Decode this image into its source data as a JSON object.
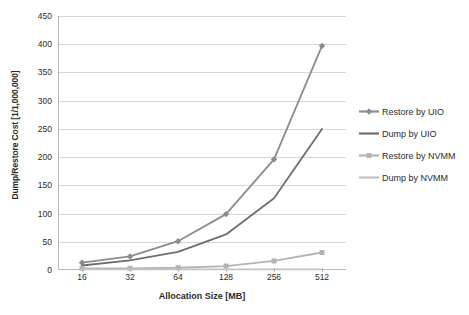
{
  "chart_data": {
    "type": "line",
    "title": "",
    "subtitle": "",
    "xlabel": "Allocation Size [MB]",
    "ylabel": "Dump/Restore Cost [1/1,000,000]",
    "categories": [
      "16",
      "32",
      "64",
      "128",
      "256",
      "512"
    ],
    "ylim": [
      0,
      450
    ],
    "yticks": [
      0,
      50,
      100,
      150,
      200,
      250,
      300,
      350,
      400,
      450
    ],
    "grid": "horizontal",
    "legend_position": "right",
    "series": [
      {
        "name": "Restore by UIO",
        "values": [
          13,
          24,
          51,
          99,
          196,
          397
        ],
        "color": "#8c8c8c",
        "marker": "diamond"
      },
      {
        "name": "Dump by UIO",
        "values": [
          8,
          17,
          32,
          63,
          127,
          250
        ],
        "color": "#6e6e6e",
        "marker": "none"
      },
      {
        "name": "Restore by NVMM",
        "values": [
          3,
          3,
          4,
          7,
          16,
          31
        ],
        "color": "#b3b3b3",
        "marker": "square"
      },
      {
        "name": "Dump by NVMM",
        "values": [
          1,
          1,
          1,
          1,
          1,
          1
        ],
        "color": "#c2c2c2",
        "marker": "none"
      }
    ]
  },
  "axes": {
    "y_title": "Dump/Restore Cost [1/1,000,000]",
    "x_title": "Allocation Size [MB]",
    "y_tick_labels": [
      "450",
      "400",
      "350",
      "300",
      "250",
      "200",
      "150",
      "100",
      "50",
      "0"
    ],
    "x_tick_labels": [
      "16",
      "32",
      "64",
      "128",
      "256",
      "512"
    ]
  },
  "legend": {
    "items": [
      {
        "label": "Restore by UIO"
      },
      {
        "label": "Dump by UIO"
      },
      {
        "label": "Restore by NVMM"
      },
      {
        "label": "Dump by NVMM"
      }
    ]
  },
  "colors": {
    "grid": "#d6d6d6",
    "axis": "#b9b9b9",
    "background": "#ffffff",
    "text": "#2b2b2b"
  }
}
